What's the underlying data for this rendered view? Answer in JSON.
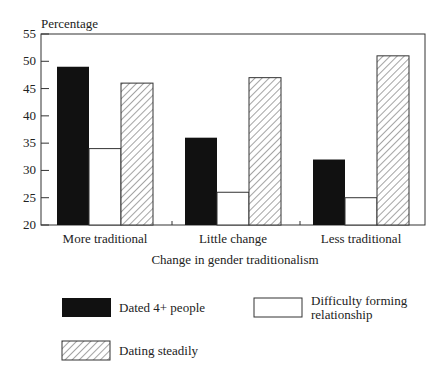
{
  "chart_data": {
    "type": "bar",
    "title": "",
    "ylabel": "Percentage",
    "xlabel": "Change in gender traditionalism",
    "ylim": [
      20,
      55
    ],
    "yticks": [
      20,
      25,
      30,
      35,
      40,
      45,
      50,
      55
    ],
    "grid": false,
    "legend_position": "bottom",
    "categories": [
      "More traditional",
      "Little change",
      "Less traditional"
    ],
    "series": [
      {
        "name": "Dated 4+ people",
        "style": "solid-black",
        "values": [
          49,
          36,
          32
        ]
      },
      {
        "name": "Difficulty forming relationship",
        "style": "white-outline",
        "values": [
          34,
          26,
          25
        ]
      },
      {
        "name": "Dating steadily",
        "style": "diagonal-hatch",
        "values": [
          46,
          47,
          51
        ]
      }
    ]
  },
  "legend": {
    "items": [
      {
        "label": "Dated 4+ people"
      },
      {
        "label_line1": "Difficulty forming",
        "label_line2": "relationship"
      },
      {
        "label": "Dating steadily"
      }
    ]
  },
  "colors": {
    "solid": "#111111",
    "outline": "#333333",
    "hatch": "#555555"
  }
}
